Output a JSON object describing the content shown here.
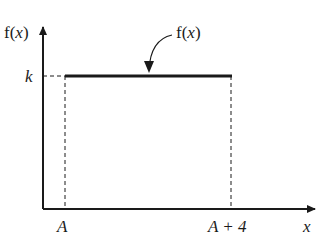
{
  "diagram": {
    "type": "uniform-distribution-pdf",
    "y_axis_label_prefix": "f(",
    "y_axis_label_var": "x",
    "y_axis_label_suffix": ")",
    "x_axis_label": "x",
    "level_label": "k",
    "curve_label_prefix": "f(",
    "curve_label_var": "x",
    "curve_label_suffix": ")",
    "x_ticks": [
      {
        "label": "A"
      },
      {
        "label": "A + 4"
      }
    ],
    "colors": {
      "ink": "#1a1a1a",
      "background": "#ffffff"
    }
  }
}
